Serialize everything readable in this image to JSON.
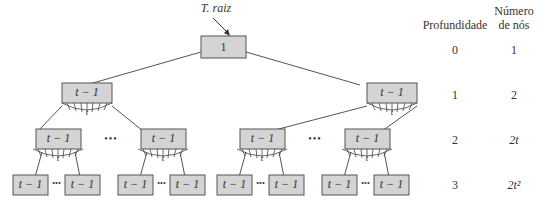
{
  "diagram": {
    "root_label": "T. raiz",
    "root_key": "1",
    "node_key": "t − 1",
    "branch_label": "t",
    "ellipsis": "•••"
  },
  "table": {
    "headers": {
      "depth": "Profundidade",
      "count_line1": "Número",
      "count_line2": "de nós"
    },
    "rows": [
      {
        "depth": "0",
        "count": "1"
      },
      {
        "depth": "1",
        "count": "2"
      },
      {
        "depth": "2",
        "count": "2t"
      },
      {
        "depth": "3",
        "count": "2t²"
      }
    ]
  },
  "colors": {
    "node_fill": "#d4d4d4",
    "node_stroke": "#555555",
    "line": "#555555"
  }
}
